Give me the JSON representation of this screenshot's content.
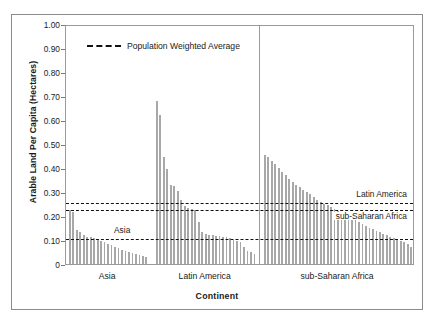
{
  "chart_data": {
    "type": "bar",
    "title": "",
    "xlabel": "Continent",
    "ylabel": "Arable Land Per Capita (Hectares)",
    "ylim": [
      0,
      1.0
    ],
    "ytick_labels": [
      "1.00",
      "0.90",
      "0.80",
      "0.70",
      "0.60",
      "0.50",
      "0.40",
      "0.30",
      "0.20",
      "0.10",
      "0"
    ],
    "ytick_values": [
      1.0,
      0.9,
      0.8,
      0.7,
      0.6,
      0.5,
      0.4,
      0.3,
      0.2,
      0.1,
      0
    ],
    "grid": false,
    "bar_color": "#a8a8a8",
    "legend": {
      "position": "top-left-inside",
      "entries": [
        {
          "label": "Population Weighted Average",
          "style": "dashed-line",
          "color": "#111111"
        }
      ]
    },
    "group_labels": [
      "Asia",
      "Latin America",
      "sub-Saharan Africa"
    ],
    "groups": [
      {
        "name": "Asia",
        "values": [
          0.225,
          0.215,
          0.14,
          0.133,
          0.12,
          0.114,
          0.112,
          0.11,
          0.104,
          0.095,
          0.09,
          0.082,
          0.078,
          0.072,
          0.066,
          0.06,
          0.055,
          0.05,
          0.046,
          0.042,
          0.038,
          0.034,
          0.03
        ]
      },
      {
        "name": "Latin America",
        "values": [
          0.68,
          0.62,
          0.445,
          0.395,
          0.33,
          0.325,
          0.305,
          0.265,
          0.24,
          0.232,
          0.228,
          0.225,
          0.175,
          0.135,
          0.126,
          0.122,
          0.12,
          0.118,
          0.116,
          0.114,
          0.112,
          0.11,
          0.1,
          0.096,
          0.09,
          0.07,
          0.055,
          0.048,
          0.04
        ]
      },
      {
        "name": "sub-Saharan Africa",
        "values": [
          0.455,
          0.445,
          0.43,
          0.415,
          0.4,
          0.385,
          0.37,
          0.355,
          0.34,
          0.33,
          0.32,
          0.31,
          0.3,
          0.29,
          0.28,
          0.268,
          0.258,
          0.25,
          0.244,
          0.238,
          0.23,
          0.222,
          0.214,
          0.206,
          0.198,
          0.19,
          0.182,
          0.174,
          0.166,
          0.158,
          0.15,
          0.144,
          0.138,
          0.132,
          0.126,
          0.12,
          0.114,
          0.108,
          0.102,
          0.096,
          0.09,
          0.082,
          0.07
        ]
      }
    ],
    "reference_lines": [
      {
        "label": "Latin America",
        "value": 0.262,
        "style": "dashed",
        "color": "#111111"
      },
      {
        "label": "sub-Saharan Africa",
        "value": 0.235,
        "style": "dashed",
        "color": "#111111"
      },
      {
        "label": "Asia",
        "value": 0.112,
        "style": "dashed",
        "color": "#111111"
      }
    ],
    "annotations": [
      {
        "text": "Latin America",
        "ref": 0.262,
        "anchor": "right-above"
      },
      {
        "text": "sub-Saharan Africa",
        "ref": 0.235,
        "anchor": "right-below"
      },
      {
        "text": "Asia",
        "ref": 0.112,
        "anchor": "left-above"
      }
    ]
  }
}
